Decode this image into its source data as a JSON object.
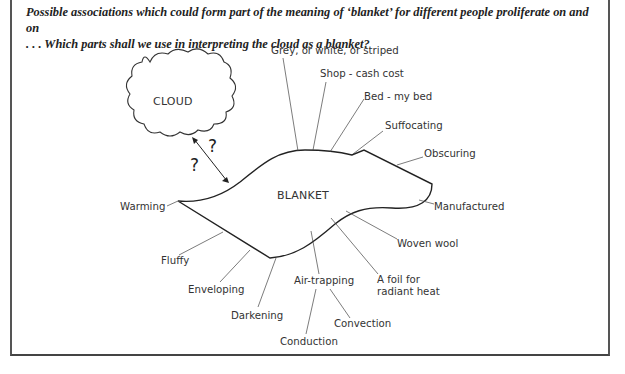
{
  "caption": {
    "line1": "Possible associations which could form part of the meaning of ‘blanket’ for different people proliferate on and on",
    "line2": ". . . Which parts shall we use in interpreting the cloud as a blanket?"
  },
  "diagram": {
    "cloud_label": "CLOUD",
    "blanket_label": "BLANKET",
    "question_marks": [
      "?",
      "?"
    ],
    "associations": {
      "grey": "Grey, or white, or striped",
      "shop": "Shop - cash cost",
      "bed": "Bed - my bed",
      "suffocating": "Suffocating",
      "obscuring": "Obscuring",
      "manufactured": "Manufactured",
      "woven_wool": "Woven wool",
      "foil_line1": "A foil for",
      "foil_line2": "radiant heat",
      "air_trapping": "Air-trapping",
      "convection": "Convection",
      "conduction": "Conduction",
      "darkening": "Darkening",
      "enveloping": "Enveloping",
      "fluffy": "Fluffy",
      "warming": "Warming"
    }
  }
}
